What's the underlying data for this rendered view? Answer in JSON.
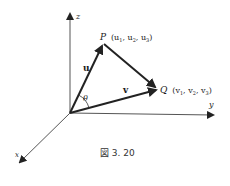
{
  "diagram": {
    "axes": {
      "z_label": "z",
      "y_label": "y",
      "x_label": "x"
    },
    "points": {
      "P": {
        "name": "P",
        "coords": "(u",
        "sub1": "1",
        "sep1": ", u",
        "sub2": "2",
        "sep2": ", u",
        "sub3": "3",
        "close": ")"
      },
      "Q": {
        "name": "Q",
        "coords": "(v",
        "sub1": "1",
        "sep1": ", v",
        "sub2": "2",
        "sep2": ", v",
        "sub3": "3",
        "close": ")"
      }
    },
    "vectors": {
      "u_label": "u",
      "v_label": "v"
    },
    "angle_label": "θ",
    "caption": "図 3. 20"
  }
}
